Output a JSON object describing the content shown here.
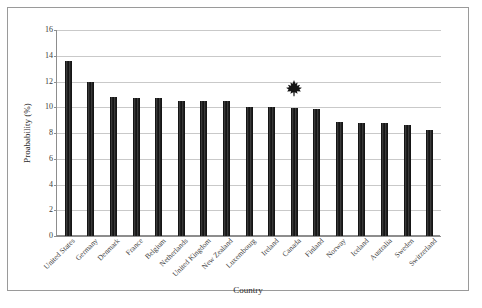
{
  "chart_data": {
    "type": "bar",
    "title": "",
    "xlabel": "Country",
    "ylabel": "Proabability (%)",
    "ylim": [
      0,
      16
    ],
    "yticks": [
      0,
      2,
      4,
      6,
      8,
      10,
      12,
      14,
      16
    ],
    "grid": true,
    "legend": false,
    "bar_color": "#1c1c1c",
    "categories": [
      "United States",
      "Germany",
      "Denmark",
      "France",
      "Belgium",
      "Netherlands",
      "United Kingdom",
      "New Zealand",
      "Luxembourg",
      "Ireland",
      "Canada",
      "Finland",
      "Norway",
      "Iceland",
      "Australia",
      "Sweden",
      "Switzerland"
    ],
    "values": [
      13.6,
      12.0,
      10.8,
      10.7,
      10.7,
      10.45,
      10.45,
      10.45,
      10.0,
      10.0,
      9.95,
      9.9,
      8.85,
      8.8,
      8.8,
      8.6,
      8.2
    ],
    "annotations": [
      {
        "name": "maple-leaf-marker",
        "icon": "maple-leaf-icon",
        "category": "Canada",
        "value": 11.5,
        "color": "#141414"
      }
    ]
  }
}
